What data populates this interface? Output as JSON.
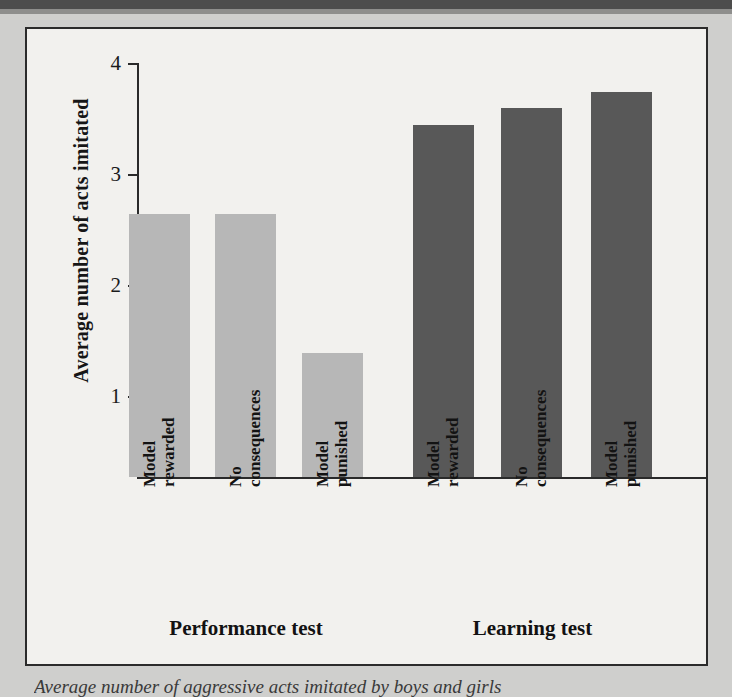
{
  "figure": {
    "caption": "Average number of aggressive acts imitated by boys and girls"
  },
  "chart_data": {
    "type": "bar",
    "title": "",
    "xlabel": "",
    "ylabel": "Average number of acts imitated",
    "ylim": [
      0,
      4
    ],
    "yticks": [
      1,
      2,
      3,
      4
    ],
    "ytick_labels": [
      "1",
      "2",
      "3",
      "4"
    ],
    "grid": false,
    "legend": "none",
    "categories": [
      "Model rewarded",
      "No consequences",
      "Model punished",
      "Model rewarded",
      "No consequences",
      "Model punished"
    ],
    "category_lines": [
      {
        "line1": "Model",
        "line2": "rewarded"
      },
      {
        "line1": "No",
        "line2": "consequences"
      },
      {
        "line1": "Model",
        "line2": "punished"
      },
      {
        "line1": "Model",
        "line2": "rewarded"
      },
      {
        "line1": "No",
        "line2": "consequences"
      },
      {
        "line1": "Model",
        "line2": "punished"
      }
    ],
    "values": [
      2.65,
      2.65,
      1.4,
      3.45,
      3.6,
      3.75
    ],
    "bar_colors": [
      "#b7b7b7",
      "#b7b7b7",
      "#b7b7b7",
      "#585858",
      "#585858",
      "#585858"
    ],
    "groups": [
      {
        "label": "Performance test",
        "color": "#b7b7b7",
        "members": [
          0,
          1,
          2
        ]
      },
      {
        "label": "Learning test",
        "color": "#585858",
        "members": [
          3,
          4,
          5
        ]
      }
    ]
  },
  "colors": {
    "light_bar": "#b7b7b7",
    "dark_bar": "#585858",
    "panel_background": "#f2f1ee",
    "page_background": "#cfcfcd",
    "axis": "#2a2a2a",
    "text": "#141414"
  }
}
